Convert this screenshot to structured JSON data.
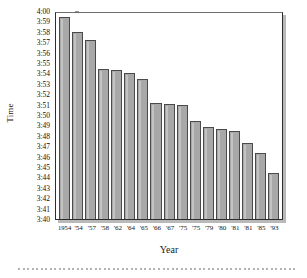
{
  "chart_data": {
    "type": "bar",
    "title": "",
    "xlabel": "Year",
    "ylabel": "Time",
    "grid": false,
    "legend": "none",
    "ylim": [
      "3:40",
      "4:00"
    ],
    "ytick_labels": [
      "4:00",
      "3:59",
      "3:58",
      "3:57",
      "3:56",
      "3:55",
      "3:54",
      "3:53",
      "3:52",
      "3:51",
      "3:50",
      "3:49",
      "3:48",
      "3:47",
      "3:46",
      "3:45",
      "3:44",
      "3:43",
      "3:42",
      "3:41",
      "3:40"
    ],
    "categories": [
      "1954",
      "'54",
      "'57",
      "'58",
      "'62",
      "'64",
      "'65",
      "'66",
      "'67",
      "'75",
      "'75",
      "'79",
      "'80",
      "'81",
      "'81",
      "'85",
      "'93"
    ],
    "values": [
      "3:59.4",
      "3:58.0",
      "3:57.2",
      "3:54.4",
      "3:54.3",
      "3:54.0",
      "3:53.5",
      "3:51.2",
      "3:51.1",
      "3:51.0",
      "3:49.4",
      "3:48.8",
      "3:48.7",
      "3:48.5",
      "3:47.3",
      "3:46.3",
      "3:44.4"
    ],
    "values_seconds": [
      239.4,
      238.0,
      237.2,
      234.4,
      234.3,
      234.0,
      233.5,
      231.2,
      231.1,
      231.0,
      229.4,
      228.8,
      228.7,
      228.5,
      227.3,
      226.3,
      224.4
    ],
    "ymin_seconds": 220,
    "ymax_seconds": 240,
    "bar_fill": "#a8a8a8",
    "bar_edge": "#4a4a4a"
  },
  "axis": {
    "y_title": "Time",
    "x_title": "Year"
  }
}
